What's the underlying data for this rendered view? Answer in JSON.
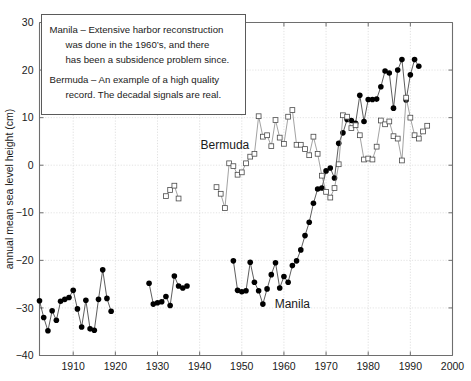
{
  "chart_data": {
    "type": "line",
    "title": "",
    "xlabel": "",
    "ylabel": "annual mean sea level height (cm)",
    "xlim": [
      1902,
      2000
    ],
    "ylim": [
      -40,
      30
    ],
    "xticks": [
      1910,
      1920,
      1930,
      1940,
      1950,
      1960,
      1970,
      1980,
      1990,
      2000
    ],
    "xticklabels": [
      "1910",
      "1920",
      "1930",
      "1940",
      "1950",
      "1960",
      "1970",
      "1980",
      "1990",
      "2000"
    ],
    "yticks": [
      -40,
      -30,
      -20,
      -10,
      0,
      10,
      20,
      30
    ],
    "yticklabels": [
      "−40",
      "−30",
      "−20",
      "−10",
      "0",
      "10",
      "20",
      "30"
    ],
    "grid": true,
    "legend_position": "inline-annotations",
    "series": [
      {
        "name": "Manila",
        "marker": "filled-circle",
        "color": "#000000",
        "label_x": 1962,
        "label_y": -30,
        "points": [
          [
            1902,
            -28.5
          ],
          [
            1903,
            -32.0
          ],
          [
            1904,
            -34.8
          ],
          [
            1905,
            -30.6
          ],
          [
            1906,
            -32.6
          ],
          [
            1907,
            -28.6
          ],
          [
            1908,
            -28.2
          ],
          [
            1909,
            -27.8
          ],
          [
            1910,
            -26.3
          ],
          [
            1911,
            -30.2
          ],
          [
            1912,
            -34.0
          ],
          [
            1913,
            -28.4
          ],
          [
            1914,
            -34.4
          ],
          [
            1915,
            -34.7
          ],
          [
            1916,
            -28.2
          ],
          [
            1917,
            -22.0
          ],
          [
            1918,
            -28.0
          ],
          [
            1919,
            -30.7
          ],
          [
            1928,
            -24.8
          ],
          [
            1929,
            -29.2
          ],
          [
            1930,
            -28.9
          ],
          [
            1931,
            -28.7
          ],
          [
            1932,
            -27.6
          ],
          [
            1933,
            -29.5
          ],
          [
            1934,
            -23.3
          ],
          [
            1935,
            -25.4
          ],
          [
            1936,
            -25.8
          ],
          [
            1937,
            -25.4
          ],
          [
            1948,
            -20.1
          ],
          [
            1949,
            -26.3
          ],
          [
            1950,
            -26.6
          ],
          [
            1951,
            -26.4
          ],
          [
            1952,
            -20.4
          ],
          [
            1953,
            -24.6
          ],
          [
            1954,
            -26.4
          ],
          [
            1955,
            -29.2
          ],
          [
            1956,
            -26.0
          ],
          [
            1957,
            -23.0
          ],
          [
            1958,
            -20.5
          ],
          [
            1959,
            -25.8
          ],
          [
            1960,
            -23.4
          ],
          [
            1961,
            -24.6
          ],
          [
            1962,
            -21.1
          ],
          [
            1963,
            -20.1
          ],
          [
            1964,
            -17.8
          ],
          [
            1965,
            -14.8
          ],
          [
            1966,
            -12.0
          ],
          [
            1967,
            -8.0
          ],
          [
            1968,
            -5.0
          ],
          [
            1969,
            -4.8
          ],
          [
            1970,
            -1.2
          ],
          [
            1971,
            -0.6
          ],
          [
            1972,
            -2.7
          ],
          [
            1973,
            4.6
          ],
          [
            1974,
            6.8
          ],
          [
            1975,
            9.6
          ],
          [
            1976,
            9.4
          ],
          [
            1977,
            8.8
          ],
          [
            1978,
            14.7
          ],
          [
            1979,
            9.2
          ],
          [
            1980,
            13.8
          ],
          [
            1981,
            13.8
          ],
          [
            1982,
            13.9
          ],
          [
            1983,
            16.5
          ],
          [
            1984,
            19.8
          ],
          [
            1985,
            19.4
          ],
          [
            1986,
            12.0
          ],
          [
            1987,
            20.0
          ],
          [
            1988,
            22.2
          ],
          [
            1989,
            13.7
          ],
          [
            1990,
            19.0
          ],
          [
            1991,
            22.2
          ],
          [
            1992,
            20.8
          ]
        ]
      },
      {
        "name": "Bermuda",
        "marker": "open-square",
        "color": "#555555",
        "label_x": 1946,
        "label_y": 3.5,
        "points": [
          [
            1932,
            -6.5
          ],
          [
            1933,
            -5.2
          ],
          [
            1934,
            -4.3
          ],
          [
            1935,
            -7.0
          ],
          [
            1944,
            -4.6
          ],
          [
            1945,
            -6.0
          ],
          [
            1946,
            -9.0
          ],
          [
            1947,
            0.4
          ],
          [
            1948,
            -0.2
          ],
          [
            1949,
            -2.0
          ],
          [
            1950,
            -1.5
          ],
          [
            1951,
            0.4
          ],
          [
            1952,
            1.8
          ],
          [
            1953,
            2.4
          ],
          [
            1954,
            10.3
          ],
          [
            1955,
            6.0
          ],
          [
            1956,
            6.3
          ],
          [
            1957,
            4.0
          ],
          [
            1958,
            9.5
          ],
          [
            1959,
            5.8
          ],
          [
            1960,
            4.5
          ],
          [
            1961,
            10.2
          ],
          [
            1962,
            11.6
          ],
          [
            1963,
            4.3
          ],
          [
            1964,
            4.3
          ],
          [
            1965,
            3.4
          ],
          [
            1966,
            2.1
          ],
          [
            1967,
            6.0
          ],
          [
            1968,
            2.4
          ],
          [
            1969,
            -2.2
          ],
          [
            1970,
            -5.6
          ],
          [
            1971,
            -6.8
          ],
          [
            1972,
            -4.8
          ],
          [
            1973,
            0.2
          ],
          [
            1974,
            10.5
          ],
          [
            1975,
            10.2
          ],
          [
            1976,
            7.8
          ],
          [
            1977,
            8.4
          ],
          [
            1978,
            6.3
          ],
          [
            1979,
            1.2
          ],
          [
            1980,
            1.4
          ],
          [
            1981,
            1.2
          ],
          [
            1982,
            3.9
          ],
          [
            1983,
            9.4
          ],
          [
            1984,
            8.6
          ],
          [
            1985,
            9.2
          ],
          [
            1986,
            6.1
          ],
          [
            1987,
            5.6
          ],
          [
            1988,
            1.0
          ],
          [
            1989,
            14.2
          ],
          [
            1990,
            10.0
          ],
          [
            1991,
            6.3
          ],
          [
            1992,
            5.6
          ],
          [
            1993,
            7.1
          ],
          [
            1994,
            8.3
          ]
        ]
      }
    ],
    "annotations": {
      "box_lines": [
        "Manila – Extensive harbor reconstruction",
        "was done in the 1960’s, and there",
        "has been a subsidence problem since.",
        "Bermuda – An example of a high quality",
        "record. The decadal signals are real."
      ]
    }
  }
}
